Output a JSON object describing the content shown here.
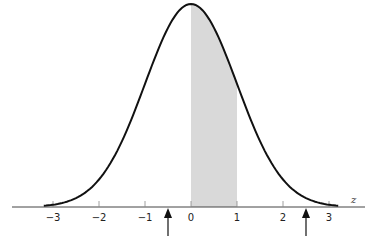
{
  "chart_data": {
    "type": "area",
    "title": "",
    "xlabel": "z",
    "ylabel": "",
    "curve": "standard normal density",
    "xlim": [
      -3.9,
      3.7
    ],
    "x_ticks": [
      -3,
      -2,
      -1,
      0,
      1,
      2,
      3
    ],
    "x_tick_labels": [
      "−3",
      "−2",
      "−1",
      "0",
      "1",
      "2",
      "3"
    ],
    "shaded_region": {
      "from": 0,
      "to": 1,
      "color": "#d9d9d9"
    },
    "arrows": [
      {
        "x": -0.5,
        "direction": "up"
      },
      {
        "x": 2.5,
        "direction": "up"
      }
    ],
    "grid": false,
    "legend": null
  },
  "colors": {
    "curve": "#111111",
    "axis": "#444444",
    "shade": "#d9d9d9",
    "arrow": "#111111"
  }
}
